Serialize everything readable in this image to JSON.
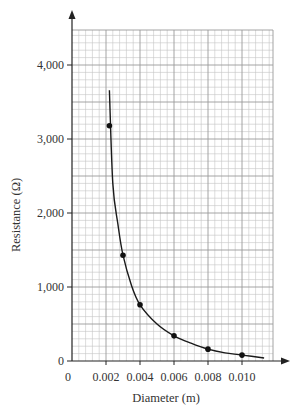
{
  "chart_data": {
    "type": "scatter",
    "title": "",
    "xlabel": "Diameter (m)",
    "ylabel": "Resistance (Ω)",
    "xlim": [
      0,
      0.0122
    ],
    "ylim": [
      0,
      4480
    ],
    "grid": true,
    "x_ticks": [
      0,
      0.002,
      0.004,
      0.006,
      0.008,
      0.01
    ],
    "x_tick_labels": [
      "0",
      "0.002",
      "0.004",
      "0.006",
      "0.008",
      "0.010"
    ],
    "y_ticks": [
      0,
      1000,
      2000,
      3000,
      4000
    ],
    "y_tick_labels": [
      "0",
      "1,000",
      "2,000",
      "3,000",
      "4,000"
    ],
    "minor_grid": {
      "x_step": 0.0004,
      "y_step": 100
    },
    "series": [
      {
        "name": "measured points",
        "type": "scatter",
        "x": [
          0.0022,
          0.003,
          0.004,
          0.006,
          0.008,
          0.01
        ],
        "y": [
          3180,
          1430,
          760,
          340,
          160,
          80
        ]
      },
      {
        "name": "best-fit curve",
        "type": "line",
        "x": [
          0.0022,
          0.0024,
          0.0027,
          0.003,
          0.0035,
          0.004,
          0.005,
          0.006,
          0.007,
          0.008,
          0.009,
          0.01,
          0.0113
        ],
        "y": [
          3660,
          2400,
          1850,
          1430,
          1020,
          760,
          500,
          340,
          240,
          160,
          110,
          80,
          40
        ]
      }
    ],
    "colors": {
      "grid": "#b8b8b8",
      "axis": "#222222",
      "curve": "#1a1a1a",
      "point": "#111111"
    }
  }
}
